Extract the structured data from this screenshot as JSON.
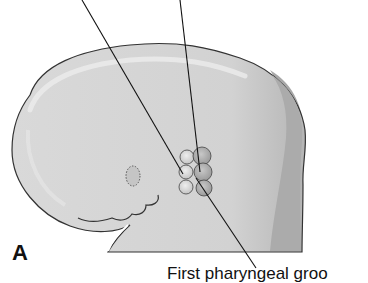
{
  "figure": {
    "panel_label": "A",
    "labels": {
      "bottom": "First pharyngeal groo"
    },
    "colors": {
      "body_fill": "#d6d6d6",
      "body_highlight": "#e6e6e6",
      "shadow": "#a9a9a9",
      "outline": "#333333",
      "leader_line": "#111111"
    }
  }
}
